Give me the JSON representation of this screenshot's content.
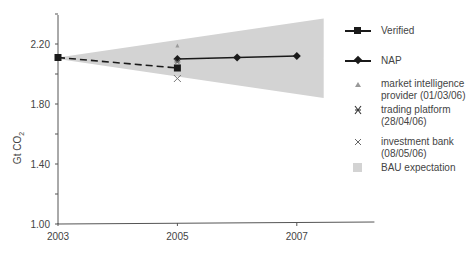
{
  "chart_data": {
    "type": "line",
    "title": "",
    "xlabel": "",
    "ylabel": "Gt CO2",
    "ylabel_display": "Gt CO",
    "ylabel_subscript": "2",
    "xlim": [
      2003,
      2008.2
    ],
    "ylim": [
      1.0,
      2.4
    ],
    "x_ticks": [
      2003,
      2005,
      2007
    ],
    "x_tick_labels": [
      "2003",
      "2005",
      "2007"
    ],
    "y_ticks": [
      1.0,
      1.4,
      1.8,
      2.2
    ],
    "y_tick_labels": [
      "1.00",
      "1.40",
      "1.80",
      "2.20"
    ],
    "grid": false,
    "legend_position": "right",
    "series": [
      {
        "name": "Verified",
        "style": "dashed-line-square",
        "x": [
          2003,
          2005
        ],
        "values": [
          2.11,
          2.04
        ]
      },
      {
        "name": "NAP",
        "style": "solid-line-diamond",
        "x": [
          2005,
          2006,
          2007
        ],
        "values": [
          2.1,
          2.11,
          2.12
        ]
      },
      {
        "name": "market intelligence provider (01/03/06)",
        "style": "triangle-marker",
        "x": [
          2005
        ],
        "values": [
          2.19
        ]
      },
      {
        "name": "trading platform (28/04/06)",
        "style": "asterisk-marker",
        "x": [
          2005
        ],
        "values": [
          2.08
        ]
      },
      {
        "name": "investment bank (08/05/06)",
        "style": "x-marker",
        "x": [
          2005
        ],
        "values": [
          1.97
        ]
      },
      {
        "name": "BAU expectation",
        "style": "shaded-area",
        "x": [
          2003,
          2007.45
        ],
        "upper": [
          2.11,
          2.37
        ],
        "lower": [
          2.1,
          1.84
        ]
      }
    ]
  },
  "legend": {
    "items": [
      {
        "label_lines": [
          "Verified"
        ]
      },
      {
        "label_lines": [
          "NAP"
        ]
      },
      {
        "label_lines": [
          "market intelligence",
          "provider (01/03/06)"
        ]
      },
      {
        "label_lines": [
          "trading platform",
          "(28/04/06)"
        ]
      },
      {
        "label_lines": [
          "investment bank",
          "(08/05/06)"
        ]
      },
      {
        "label_lines": [
          "BAU expectation"
        ]
      }
    ]
  },
  "colors": {
    "band": "#d3d3d3",
    "line": "#1a1a1a",
    "axis": "#555555",
    "marker_light": "#999999"
  }
}
